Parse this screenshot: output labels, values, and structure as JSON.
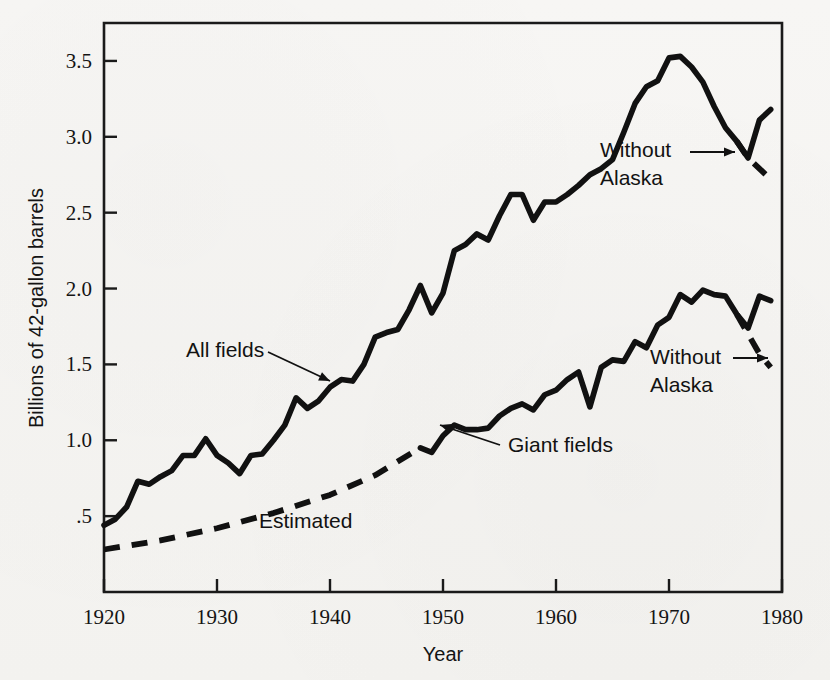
{
  "figure": {
    "background_color": "#f5f4f2",
    "ink_color": "#111111"
  },
  "chart_data": {
    "type": "line",
    "title": "",
    "xlabel": "Year",
    "ylabel": "Billions of 42-gallon barrels",
    "xlim": [
      1920,
      1980
    ],
    "ylim": [
      0,
      3.75
    ],
    "xticks": [
      1920,
      1930,
      1940,
      1950,
      1960,
      1970,
      1980
    ],
    "xtick_labels": [
      "1920",
      "1930",
      "1940",
      "1950",
      "1960",
      "1970",
      "1980"
    ],
    "yticks": [
      0.5,
      1.0,
      1.5,
      2.0,
      2.5,
      3.0,
      3.5
    ],
    "ytick_labels": [
      ".5",
      "1.0",
      "1.5",
      "2.0",
      "2.5",
      "3.0",
      "3.5"
    ],
    "grid": false,
    "legend": "none (inline annotations)",
    "series": [
      {
        "name": "All fields",
        "style": "solid",
        "x": [
          1920,
          1921,
          1922,
          1923,
          1924,
          1925,
          1926,
          1927,
          1928,
          1929,
          1930,
          1931,
          1932,
          1933,
          1934,
          1935,
          1936,
          1937,
          1938,
          1939,
          1940,
          1941,
          1942,
          1943,
          1944,
          1945,
          1946,
          1947,
          1948,
          1949,
          1950,
          1951,
          1952,
          1953,
          1954,
          1955,
          1956,
          1957,
          1958,
          1959,
          1960,
          1961,
          1962,
          1963,
          1964,
          1965,
          1966,
          1967,
          1968,
          1969,
          1970,
          1971,
          1972,
          1973,
          1974,
          1975,
          1976,
          1977,
          1978,
          1979
        ],
        "values": [
          0.44,
          0.48,
          0.56,
          0.73,
          0.71,
          0.76,
          0.8,
          0.9,
          0.9,
          1.01,
          0.9,
          0.85,
          0.78,
          0.9,
          0.91,
          1.0,
          1.1,
          1.28,
          1.21,
          1.26,
          1.35,
          1.4,
          1.39,
          1.5,
          1.68,
          1.71,
          1.73,
          1.86,
          2.02,
          1.84,
          1.97,
          2.25,
          2.29,
          2.36,
          2.32,
          2.48,
          2.62,
          2.62,
          2.45,
          2.57,
          2.57,
          2.62,
          2.68,
          2.75,
          2.79,
          2.85,
          3.03,
          3.22,
          3.33,
          3.37,
          3.52,
          3.53,
          3.46,
          3.36,
          3.2,
          3.06,
          2.97,
          2.86,
          3.11,
          3.18
        ]
      },
      {
        "name": "All fields — Without Alaska",
        "style": "dashed",
        "x": [
          1976,
          1977,
          1978,
          1979
        ],
        "values": [
          2.97,
          2.86,
          2.79,
          2.72
        ]
      },
      {
        "name": "Giant fields (Estimated)",
        "style": "dashed",
        "x": [
          1920,
          1925,
          1930,
          1935,
          1940,
          1944,
          1948
        ],
        "values": [
          0.28,
          0.34,
          0.42,
          0.52,
          0.64,
          0.77,
          0.95
        ]
      },
      {
        "name": "Giant fields",
        "style": "solid",
        "x": [
          1948,
          1949,
          1950,
          1951,
          1952,
          1953,
          1954,
          1955,
          1956,
          1957,
          1958,
          1959,
          1960,
          1961,
          1962,
          1963,
          1964,
          1965,
          1966,
          1967,
          1968,
          1969,
          1970,
          1971,
          1972,
          1973,
          1974,
          1975,
          1976,
          1977,
          1978,
          1979
        ],
        "values": [
          0.95,
          0.92,
          1.03,
          1.1,
          1.07,
          1.07,
          1.08,
          1.16,
          1.21,
          1.24,
          1.2,
          1.3,
          1.33,
          1.4,
          1.45,
          1.22,
          1.48,
          1.53,
          1.52,
          1.65,
          1.61,
          1.76,
          1.81,
          1.96,
          1.91,
          1.99,
          1.96,
          1.95,
          1.83,
          1.74,
          1.95,
          1.92
        ]
      },
      {
        "name": "Giant fields — Without Alaska",
        "style": "dashed",
        "x": [
          1976,
          1977,
          1978,
          1979
        ],
        "values": [
          1.83,
          1.7,
          1.57,
          1.48
        ]
      }
    ],
    "annotations": [
      {
        "id": "all-fields",
        "text": "All fields",
        "text_line_2": "",
        "x_px": 186,
        "y_px": 357,
        "leader_from": [
          268,
          352
        ],
        "leader_to": [
          330,
          381
        ]
      },
      {
        "id": "without-alaska-upper",
        "text": "Without",
        "text_line_2": "Alaska",
        "x_px": 600,
        "y_px": 157,
        "leader_from": [
          690,
          152
        ],
        "leader_to": [
          735,
          152
        ]
      },
      {
        "id": "without-alaska-lower",
        "text": "Without",
        "text_line_2": "Alaska",
        "x_px": 650,
        "y_px": 364,
        "leader_from": [
          733,
          358
        ],
        "leader_to": [
          768,
          358
        ]
      },
      {
        "id": "giant-fields",
        "text": "Giant fields",
        "text_line_2": "",
        "x_px": 508,
        "y_px": 452,
        "leader_from": [
          500,
          445
        ],
        "leader_to": [
          440,
          425
        ]
      },
      {
        "id": "estimated",
        "text": "Estimated",
        "text_line_2": "",
        "x_px": 259,
        "y_px": 528,
        "leader_from": null,
        "leader_to": null
      }
    ]
  }
}
